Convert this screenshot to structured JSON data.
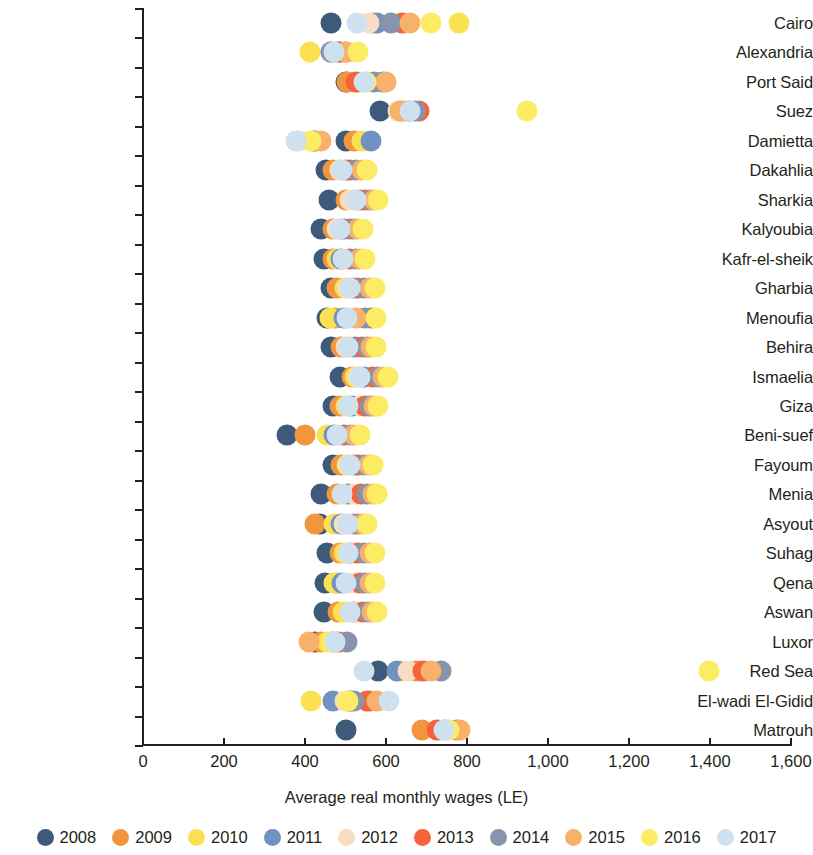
{
  "chart_data": {
    "type": "scatter",
    "title": "",
    "xlabel": "Average real monthly wages (LE)",
    "ylabel": "",
    "xlim": [
      0,
      1600
    ],
    "xticks": [
      0,
      200,
      400,
      600,
      800,
      1000,
      1200,
      1400,
      1600
    ],
    "xticklabels": [
      "0",
      "200",
      "400",
      "600",
      "800",
      "1,000",
      "1,200",
      "1,400",
      "1,600"
    ],
    "grid": false,
    "legend_position": "bottom",
    "categories": [
      "Cairo",
      "Alexandria",
      "Port Said",
      "Suez",
      "Damietta",
      "Dakahlia",
      "Sharkia",
      "Kalyoubia",
      "Kafr-el-sheik",
      "Gharbia",
      "Menoufia",
      "Behira",
      "Ismaelia",
      "Giza",
      "Beni-suef",
      "Fayoum",
      "Menia",
      "Asyout",
      "Suhag",
      "Qena",
      "Aswan",
      "Luxor",
      "Red Sea",
      "El-wadi El-Gidid",
      "Matrouh"
    ],
    "series": [
      {
        "name": "2008",
        "color": "#3d5a7a",
        "values": [
          465,
          487,
          500,
          585,
          502,
          452,
          460,
          440,
          447,
          465,
          455,
          463,
          487,
          470,
          355,
          468,
          440,
          438,
          455,
          450,
          447,
          424,
          580,
          512,
          502
        ]
      },
      {
        "name": "2009",
        "color": "#f1953f",
        "values": [
          568,
          498,
          503,
          640,
          520,
          470,
          500,
          470,
          468,
          480,
          473,
          490,
          515,
          487,
          400,
          490,
          480,
          425,
          487,
          480,
          482,
          440,
          675,
          560,
          690
        ]
      },
      {
        "name": "2010",
        "color": "#fbe052",
        "values": [
          780,
          413,
          532,
          650,
          540,
          487,
          520,
          487,
          478,
          498,
          462,
          512,
          523,
          500,
          455,
          503,
          500,
          472,
          497,
          472,
          495,
          455,
          640,
          415,
          730
        ]
      },
      {
        "name": "2011",
        "color": "#6f92c0",
        "values": [
          577,
          463,
          593,
          658,
          563,
          500,
          535,
          497,
          488,
          520,
          497,
          523,
          545,
          515,
          472,
          520,
          508,
          490,
          512,
          492,
          520,
          468,
          627,
          470,
          745
        ]
      },
      {
        "name": "2012",
        "color": "#f8ddc2",
        "values": [
          558,
          508,
          552,
          630,
          385,
          487,
          512,
          478,
          500,
          507,
          508,
          500,
          530,
          537,
          487,
          505,
          520,
          497,
          520,
          522,
          527,
          490,
          655,
          498,
          747
        ]
      },
      {
        "name": "2013",
        "color": "#f4633a",
        "values": [
          640,
          478,
          527,
          682,
          420,
          512,
          548,
          510,
          512,
          532,
          563,
          540,
          567,
          548,
          497,
          530,
          538,
          518,
          532,
          535,
          542,
          482,
          692,
          553,
          727
        ]
      },
      {
        "name": "2014",
        "color": "#8794ab",
        "values": [
          612,
          465,
          570,
          672,
          425,
          527,
          560,
          520,
          525,
          545,
          548,
          552,
          580,
          560,
          512,
          545,
          553,
          530,
          545,
          548,
          555,
          503,
          737,
          520,
          775
        ]
      },
      {
        "name": "2015",
        "color": "#f8b16a",
        "values": [
          660,
          500,
          600,
          635,
          440,
          540,
          570,
          532,
          535,
          560,
          525,
          563,
          593,
          570,
          522,
          557,
          568,
          543,
          560,
          560,
          565,
          410,
          712,
          577,
          782
        ]
      },
      {
        "name": "2016",
        "color": "#fbec63",
        "values": [
          712,
          530,
          550,
          947,
          415,
          552,
          580,
          543,
          548,
          572,
          575,
          575,
          605,
          580,
          535,
          568,
          578,
          553,
          572,
          573,
          578,
          465,
          1397,
          505,
          755
        ]
      },
      {
        "name": "2017",
        "color": "#cfe0ef",
        "values": [
          528,
          472,
          545,
          660,
          378,
          492,
          525,
          487,
          493,
          512,
          503,
          507,
          537,
          505,
          480,
          512,
          492,
          505,
          507,
          502,
          512,
          475,
          545,
          607,
          742
        ]
      }
    ]
  },
  "legend": {
    "items": [
      {
        "label": "2008",
        "color": "#3d5a7a"
      },
      {
        "label": "2009",
        "color": "#f1953f"
      },
      {
        "label": "2010",
        "color": "#fbe052"
      },
      {
        "label": "2011",
        "color": "#6f92c0"
      },
      {
        "label": "2012",
        "color": "#f8ddc2"
      },
      {
        "label": "2013",
        "color": "#f4633a"
      },
      {
        "label": "2014",
        "color": "#8794ab"
      },
      {
        "label": "2015",
        "color": "#f8b16a"
      },
      {
        "label": "2016",
        "color": "#fbec63"
      },
      {
        "label": "2017",
        "color": "#cfe0ef"
      }
    ]
  }
}
